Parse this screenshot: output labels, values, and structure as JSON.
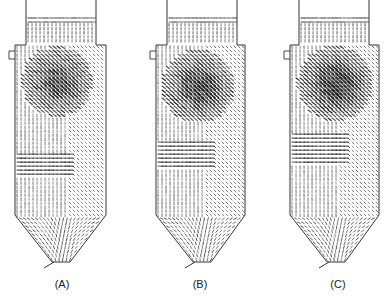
{
  "figure": {
    "colors": {
      "background": "#ffffff",
      "outline": "#333333",
      "vector": "#1a1a1a",
      "label": "#222222"
    },
    "panels": [
      {
        "id": "A",
        "label": "(A)",
        "offset_x": 0,
        "label_x": 42,
        "geometry": {
          "stack_left": 26,
          "stack_right": 96,
          "stack_top": 14,
          "shoulder_y": 45,
          "body_left": 15,
          "body_right": 106,
          "cone_start_y": 215,
          "outlet_left": 52,
          "outlet_right": 70,
          "outlet_y": 262,
          "inlet_y": 55
        },
        "vortex": {
          "cx": 55,
          "cy": 80,
          "strength": 1.0
        },
        "swirl_band_y": [
          150,
          175
        ]
      },
      {
        "id": "B",
        "label": "(B)",
        "offset_x": 141,
        "label_x": 180,
        "geometry": {
          "stack_left": 26,
          "stack_right": 96,
          "stack_top": 14,
          "shoulder_y": 45,
          "body_left": 15,
          "body_right": 104,
          "cone_start_y": 215,
          "outlet_left": 52,
          "outlet_right": 70,
          "outlet_y": 262,
          "inlet_y": 55
        },
        "vortex": {
          "cx": 55,
          "cy": 85,
          "strength": 1.1
        },
        "swirl_band_y": [
          140,
          170
        ]
      },
      {
        "id": "C",
        "label": "(C)",
        "offset_x": 275,
        "label_x": 318,
        "geometry": {
          "stack_left": 24,
          "stack_right": 94,
          "stack_top": 14,
          "shoulder_y": 45,
          "body_left": 15,
          "body_right": 104,
          "cone_start_y": 215,
          "outlet_left": 52,
          "outlet_right": 70,
          "outlet_y": 262,
          "inlet_y": 55
        },
        "vortex": {
          "cx": 58,
          "cy": 82,
          "strength": 1.2
        },
        "swirl_band_y": [
          130,
          165
        ]
      }
    ]
  }
}
